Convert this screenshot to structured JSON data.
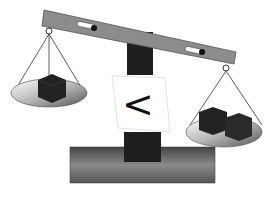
{
  "scene": {
    "description": "Balance scale illustration",
    "left_pan": {
      "cubes": 1
    },
    "right_pan": {
      "cubes": 2
    },
    "comparison_symbol": "<",
    "colors": {
      "beam": "#8a8a8a",
      "post": "#1e1e1e",
      "base": "#6a6a6a",
      "pan": "#b0b0b0",
      "cube": "#222222",
      "sign": "#ffffff"
    }
  }
}
